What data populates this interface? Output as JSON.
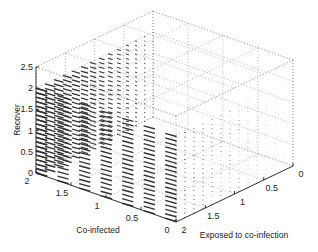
{
  "chart_data": {
    "type": "quiver3d",
    "title": "",
    "xlabel": "Exposed to co-infection",
    "ylabel": "Co-infected",
    "zlabel": "Recover",
    "xlim": [
      0,
      2
    ],
    "ylim": [
      0,
      2
    ],
    "zlim": [
      0,
      2.5
    ],
    "xticks": [
      "0",
      "0.5",
      "1",
      "1.5",
      "2"
    ],
    "yticks": [
      "0",
      "0.5",
      "1",
      "1.5",
      "2"
    ],
    "zticks": [
      "0",
      "0.5",
      "1",
      "1.5",
      "2",
      "2.5"
    ],
    "grid": true,
    "grid_x": [
      0,
      2
    ],
    "grid_y": [
      0,
      2
    ],
    "grid_z": [
      0,
      2
    ],
    "grid_count": [
      14,
      14,
      20
    ],
    "field_direction": "arrows point toward decreasing Co-infected, magnitude decreases with decreasing Exposed"
  }
}
